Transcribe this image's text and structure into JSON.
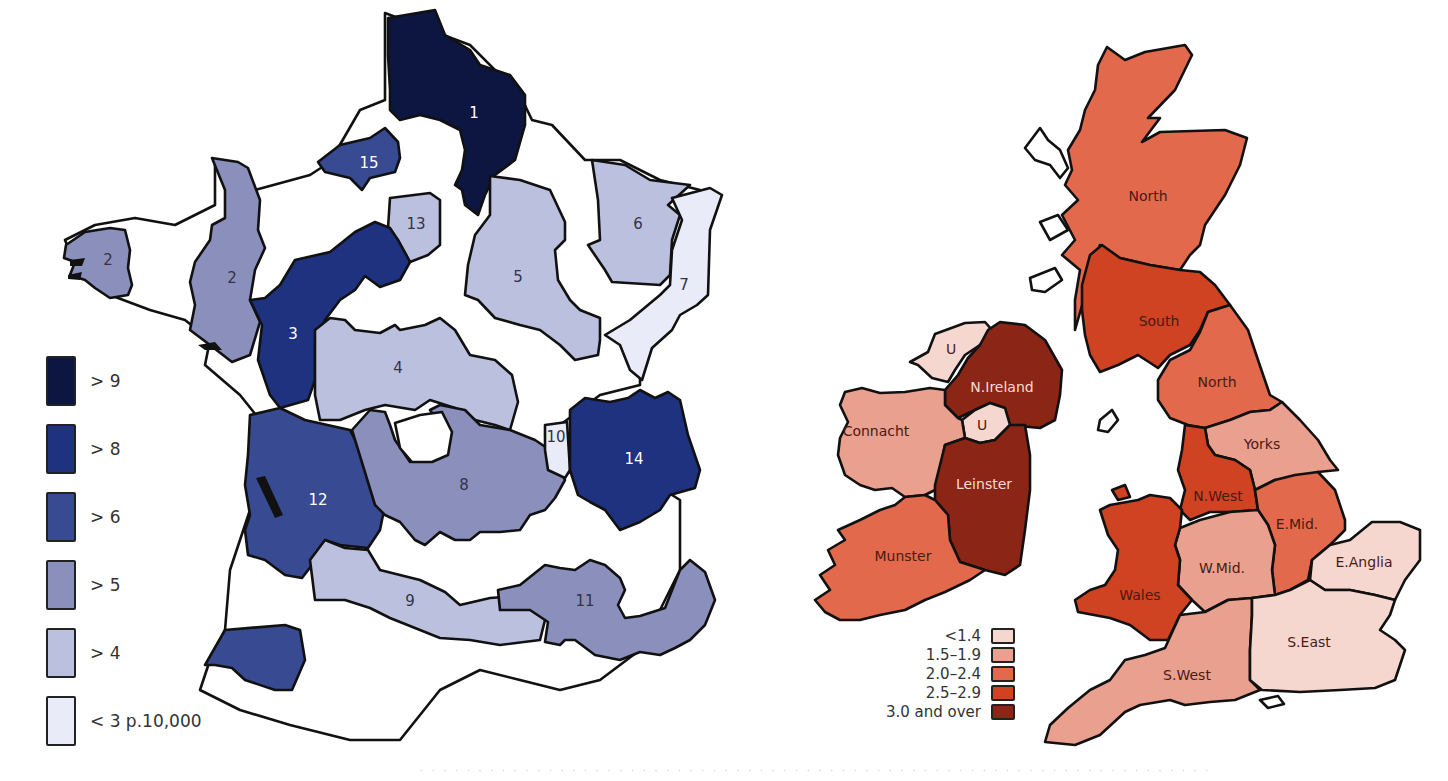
{
  "france_map": {
    "legend": [
      {
        "label": "> 9",
        "color": "#0d1640"
      },
      {
        "label": "> 8",
        "color": "#1f3280"
      },
      {
        "label": "> 6",
        "color": "#384a92"
      },
      {
        "label": "> 5",
        "color": "#8a8fbc"
      },
      {
        "label": "> 4",
        "color": "#bcc0df"
      },
      {
        "label": "< 3 p.10,000",
        "color": "#e9ecf8"
      }
    ],
    "regions": [
      {
        "id": "1",
        "label": "1",
        "class": "> 9"
      },
      {
        "id": "2a",
        "label": "2",
        "class": "> 5"
      },
      {
        "id": "2b",
        "label": "2",
        "class": "> 5"
      },
      {
        "id": "3",
        "label": "3",
        "class": "> 8"
      },
      {
        "id": "4",
        "label": "4",
        "class": "> 4"
      },
      {
        "id": "5",
        "label": "5",
        "class": "> 4"
      },
      {
        "id": "6",
        "label": "6",
        "class": "> 4"
      },
      {
        "id": "7",
        "label": "7",
        "class": "< 3 p.10,000"
      },
      {
        "id": "8",
        "label": "8",
        "class": "> 5"
      },
      {
        "id": "9",
        "label": "9",
        "class": "> 4"
      },
      {
        "id": "10",
        "label": "10",
        "class": "< 3 p.10,000"
      },
      {
        "id": "11",
        "label": "11",
        "class": "> 5"
      },
      {
        "id": "12",
        "label": "12",
        "class": "> 6"
      },
      {
        "id": "13",
        "label": "13",
        "class": "> 4"
      },
      {
        "id": "14",
        "label": "14",
        "class": "> 8"
      },
      {
        "id": "15",
        "label": "15",
        "class": "> 6"
      }
    ]
  },
  "uk_map": {
    "legend": [
      {
        "label": "<1.4",
        "color": "#f6d7d0"
      },
      {
        "label": "1.5–1.9",
        "color": "#e9a08e"
      },
      {
        "label": "2.0–2.4",
        "color": "#e3694c"
      },
      {
        "label": "2.5–2.9",
        "color": "#cf4222"
      },
      {
        "label": "3.0 and over",
        "color": "#8b2516"
      }
    ],
    "regions": [
      {
        "label": "North",
        "country": "Scotland",
        "class": "2.0–2.4"
      },
      {
        "label": "South",
        "country": "Scotland",
        "class": "2.5–2.9"
      },
      {
        "label": "North",
        "country": "England",
        "class": "2.0–2.4"
      },
      {
        "label": "Yorks",
        "class": "1.5–1.9"
      },
      {
        "label": "N.West",
        "class": "2.5–2.9"
      },
      {
        "label": "E.Mid.",
        "class": "2.0–2.4"
      },
      {
        "label": "W.Mid.",
        "class": "1.5–1.9"
      },
      {
        "label": "E.Anglia",
        "class": "<1.4"
      },
      {
        "label": "Wales",
        "class": "2.5–2.9"
      },
      {
        "label": "S.West",
        "class": "1.5–1.9"
      },
      {
        "label": "S.East",
        "class": "<1.4"
      },
      {
        "label": "U",
        "class": "<1.4"
      },
      {
        "label": "N.Ireland",
        "class": "3.0 and over"
      },
      {
        "label": "U",
        "class": "<1.4"
      },
      {
        "label": "Connacht",
        "class": "1.5–1.9"
      },
      {
        "label": "Leinster",
        "class": "3.0 and over"
      },
      {
        "label": "Munster",
        "class": "2.0–2.4"
      }
    ]
  },
  "footer": {
    "caption": "· · · · · · · · · · · · · · · · · · · · · · · · · · · · · · · · · · · · · · · · · · · · · · · · · · · · · · · · · · · · · · · · · · · ·"
  }
}
